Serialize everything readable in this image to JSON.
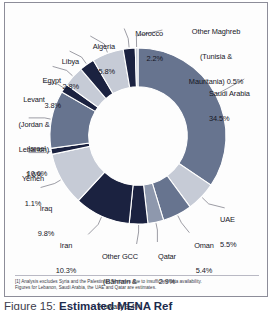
{
  "figure": {
    "caption_prefix": "Figure 15:",
    "caption_title": "Estimated MENA Ref",
    "footnote_line1": "[1] Analysis excludes Syria and the Palestinian Territories due to insufficient data availability.",
    "footnote_line2": "Figures for Lebanon, Saudi Arabia, the UAE and Qatar are estimates."
  },
  "palette": {
    "slate": "#67748f",
    "light": "#c6cbd6",
    "navy": "#1b2240",
    "mid": "#8e98ad",
    "background": "#ffffff",
    "leader": "#5a5a68"
  },
  "chart_data": {
    "type": "pie",
    "xlabel": "",
    "ylabel": "",
    "units": "percent",
    "donut_hole_ratio": 0.56,
    "start_angle_deg": 0,
    "direction": "clockwise",
    "legend_position": "outside-labels",
    "grid": false,
    "total": 100.0,
    "categories": [
      "Saudi Arabia",
      "UAE",
      "Oman",
      "Qatar",
      "Other GCC (Bahrain & Kuwait)",
      "Iran",
      "Iraq",
      "Yemen",
      "Israel",
      "Levant (Jordan & Lebanon)",
      "Egypt",
      "Libya",
      "Algeria",
      "Morocco",
      "Other Maghreb (Tunisia & Mauritania)"
    ],
    "values": [
      34.5,
      5.5,
      5.4,
      2.9,
      3.4,
      10.3,
      9.8,
      1.1,
      10.6,
      1.6,
      3.8,
      2.8,
      5.8,
      2.2,
      0.5
    ],
    "colors": [
      "#67748f",
      "#c6cbd6",
      "#67748f",
      "#8e98ad",
      "#1b2240",
      "#1b2240",
      "#c6cbd6",
      "#1b2240",
      "#67748f",
      "#1b2240",
      "#c6cbd6",
      "#1b2240",
      "#c6cbd6",
      "#1b2240",
      "#c6cbd6"
    ],
    "labels": [
      {
        "name": "Saudi Arabia",
        "value": "34.5%",
        "text": "Saudi Arabia\n34.5%"
      },
      {
        "name": "UAE",
        "value": "5.5%",
        "text": "UAE\n5.5%"
      },
      {
        "name": "Oman",
        "value": "5.4%",
        "text": "Oman\n5.4%"
      },
      {
        "name": "Qatar",
        "value": "2.9%",
        "text": "Qatar\n2.9%"
      },
      {
        "name": "Other GCC (Bahrain & Kuwait)",
        "value": "3.4%",
        "text": "Other GCC\n(Bahrain &\nKuwait) 3.4%"
      },
      {
        "name": "Iran",
        "value": "10.3%",
        "text": "Iran\n10.3%"
      },
      {
        "name": "Iraq",
        "value": "9.8%",
        "text": "Iraq\n9.8%"
      },
      {
        "name": "Yemen",
        "value": "1.1%",
        "text": "Yemen\n1.1%"
      },
      {
        "name": "Israel",
        "value": "10.6%",
        "text": "Israel\n10.6%"
      },
      {
        "name": "Levant (Jordan & Lebanon)",
        "value": "1.6%",
        "text": "Levant\n(Jordan &\nLebanon)\n1.6%"
      },
      {
        "name": "Egypt",
        "value": "3.8%",
        "text": "Egypt\n3.8%"
      },
      {
        "name": "Libya",
        "value": "2.8%",
        "text": "Libya\n2.8%"
      },
      {
        "name": "Algeria",
        "value": "5.8%",
        "text": "Algeria\n5.8%"
      },
      {
        "name": "Morocco",
        "value": "2.2%",
        "text": "Morocco\n2.2%"
      },
      {
        "name": "Other Maghreb (Tunisia & Mauritania)",
        "value": "0.5%",
        "text": "Other Maghreb\n(Tunisia &\nMauritania) 0.5%"
      }
    ]
  }
}
